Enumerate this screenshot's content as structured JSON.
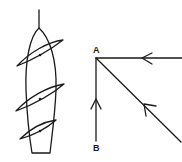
{
  "diagram": {
    "left_figure": {
      "description": "sailboat viewed from above with three sails",
      "sail_count": 3
    },
    "right_figure": {
      "point_a_label": "A",
      "point_b_label": "B",
      "vectors": [
        {
          "name": "horizontal",
          "direction": "toward A from right"
        },
        {
          "name": "diagonal",
          "direction": "toward A from lower right"
        },
        {
          "name": "vertical",
          "direction": "from B up toward A"
        }
      ]
    },
    "colors": {
      "stroke": "#1a1a1a",
      "background": "#ffffff"
    }
  }
}
